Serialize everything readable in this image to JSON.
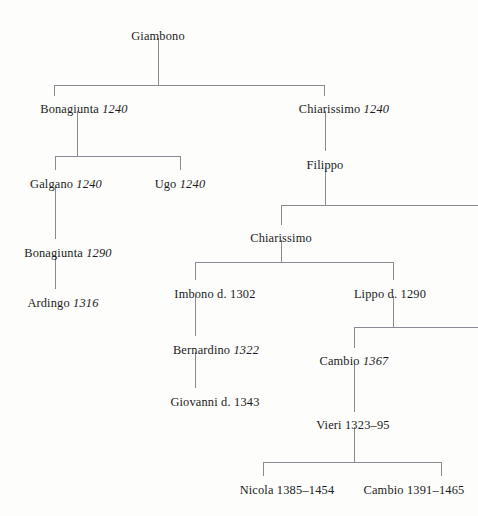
{
  "diagram": {
    "line_color": "#8a8a93",
    "text_color": "#1b1b22",
    "background": "#fdfdfc",
    "nodes": [
      {
        "id": "giambono",
        "name": "Giambono",
        "date": "",
        "date_style": "none",
        "x": 158,
        "y": 30
      },
      {
        "id": "bonagiunta1",
        "name": "Bonagiunta",
        "date": "1240",
        "date_style": "italic",
        "x": 84,
        "y": 103
      },
      {
        "id": "chiarissimo1",
        "name": "Chiarissimo",
        "date": "1240",
        "date_style": "italic",
        "x": 344,
        "y": 103
      },
      {
        "id": "galgano",
        "name": "Galgano",
        "date": "1240",
        "date_style": "italic",
        "x": 66,
        "y": 178
      },
      {
        "id": "ugo",
        "name": "Ugo",
        "date": "1240",
        "date_style": "italic",
        "x": 180,
        "y": 178
      },
      {
        "id": "filippo",
        "name": "Filippo",
        "date": "",
        "date_style": "none",
        "x": 325,
        "y": 159
      },
      {
        "id": "bonagiunta2",
        "name": "Bonagiunta",
        "date": "1290",
        "date_style": "italic",
        "x": 68,
        "y": 247
      },
      {
        "id": "chiarissimo2",
        "name": "Chiarissimo",
        "date": "",
        "date_style": "none",
        "x": 281,
        "y": 232
      },
      {
        "id": "ardingo",
        "name": "Ardingo",
        "date": "1316",
        "date_style": "italic",
        "x": 63,
        "y": 297
      },
      {
        "id": "imbono",
        "name": "Imbono",
        "date": "d. 1302",
        "date_style": "roman",
        "x": 215,
        "y": 288
      },
      {
        "id": "lippo",
        "name": "Lippo",
        "date": "d. 1290",
        "date_style": "roman",
        "x": 390,
        "y": 288
      },
      {
        "id": "bernardino",
        "name": "Bernardino",
        "date": "1322",
        "date_style": "italic",
        "x": 216,
        "y": 344
      },
      {
        "id": "cambio1",
        "name": "Cambio",
        "date": "1367",
        "date_style": "italic",
        "x": 354,
        "y": 355
      },
      {
        "id": "giovanni",
        "name": "Giovanni",
        "date": "d. 1343",
        "date_style": "roman",
        "x": 215,
        "y": 396
      },
      {
        "id": "vieri",
        "name": "Vieri",
        "date": "1323–95",
        "date_style": "roman",
        "x": 353,
        "y": 419
      },
      {
        "id": "nicola",
        "name": "Nicola",
        "date": "1385–1454",
        "date_style": "roman",
        "x": 287,
        "y": 484
      },
      {
        "id": "cambio2",
        "name": "Cambio",
        "date": "1391–1465",
        "date_style": "roman",
        "x": 414,
        "y": 484
      }
    ],
    "connectors": [
      {
        "id": "giambono-stem",
        "type": "v",
        "x": 158,
        "y1": 38,
        "y2": 85
      },
      {
        "id": "giambono-bar",
        "type": "h",
        "y": 85,
        "x1": 54,
        "x2": 324
      },
      {
        "id": "bonagiunta1-drop",
        "type": "v",
        "x": 54,
        "y1": 85,
        "y2": 96
      },
      {
        "id": "chiarissimo1-drop",
        "type": "v",
        "x": 324,
        "y1": 85,
        "y2": 96
      },
      {
        "id": "bonagiunta1-stem",
        "type": "v",
        "x": 77,
        "y1": 111,
        "y2": 156
      },
      {
        "id": "bonagiunta1-bar",
        "type": "h",
        "y": 156,
        "x1": 55,
        "x2": 180
      },
      {
        "id": "galgano-drop",
        "type": "v",
        "x": 55,
        "y1": 156,
        "y2": 170
      },
      {
        "id": "ugo-drop",
        "type": "v",
        "x": 180,
        "y1": 156,
        "y2": 170
      },
      {
        "id": "chiarissimo1-stem",
        "type": "v",
        "x": 325,
        "y1": 111,
        "y2": 151
      },
      {
        "id": "galgano-stem",
        "type": "v",
        "x": 55,
        "y1": 186,
        "y2": 239
      },
      {
        "id": "filippo-stem",
        "type": "v",
        "x": 325,
        "y1": 167,
        "y2": 205
      },
      {
        "id": "filippo-bar",
        "type": "h",
        "y": 205,
        "x1": 281,
        "x2": 478
      },
      {
        "id": "chiarissimo2-drop",
        "type": "v",
        "x": 281,
        "y1": 205,
        "y2": 225
      },
      {
        "id": "bonagiunta2-stem",
        "type": "v",
        "x": 55,
        "y1": 255,
        "y2": 289
      },
      {
        "id": "chiarissimo2-stem",
        "type": "v",
        "x": 281,
        "y1": 240,
        "y2": 262
      },
      {
        "id": "chiarissimo2-bar",
        "type": "h",
        "y": 262,
        "x1": 195,
        "x2": 393
      },
      {
        "id": "imbono-drop",
        "type": "v",
        "x": 195,
        "y1": 262,
        "y2": 280
      },
      {
        "id": "lippo-drop",
        "type": "v",
        "x": 393,
        "y1": 262,
        "y2": 280
      },
      {
        "id": "imbono-stem",
        "type": "v",
        "x": 195,
        "y1": 296,
        "y2": 336
      },
      {
        "id": "lippo-stem",
        "type": "v",
        "x": 393,
        "y1": 296,
        "y2": 327
      },
      {
        "id": "lippo-bar",
        "type": "h",
        "y": 327,
        "x1": 354,
        "x2": 478
      },
      {
        "id": "cambio1-drop",
        "type": "v",
        "x": 354,
        "y1": 327,
        "y2": 348
      },
      {
        "id": "bernardino-stem",
        "type": "v",
        "x": 195,
        "y1": 352,
        "y2": 388
      },
      {
        "id": "cambio1-stem",
        "type": "v",
        "x": 354,
        "y1": 363,
        "y2": 412
      },
      {
        "id": "vieri-stem",
        "type": "v",
        "x": 354,
        "y1": 427,
        "y2": 462
      },
      {
        "id": "vieri-bar",
        "type": "h",
        "y": 462,
        "x1": 263,
        "x2": 441
      },
      {
        "id": "nicola-drop",
        "type": "v",
        "x": 263,
        "y1": 462,
        "y2": 476
      },
      {
        "id": "cambio2-drop",
        "type": "v",
        "x": 441,
        "y1": 462,
        "y2": 476
      }
    ]
  }
}
